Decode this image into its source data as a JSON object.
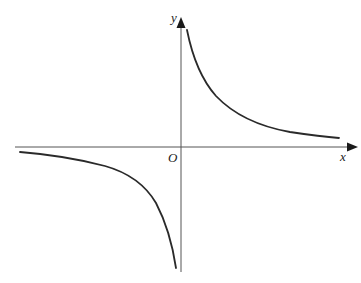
{
  "diagram": {
    "type": "graph-of-function",
    "axes": {
      "x_label": "x",
      "y_label": "y",
      "origin_label": "O",
      "color": "#555555"
    },
    "curve": {
      "color": "#2a2a2a",
      "branches": [
        {
          "name": "upper-right",
          "quadrant": "I"
        },
        {
          "name": "lower-left",
          "quadrant": "III"
        }
      ]
    }
  }
}
